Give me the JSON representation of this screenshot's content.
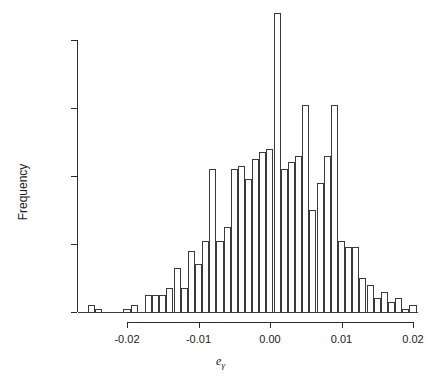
{
  "chart_data": {
    "type": "bar",
    "title": "",
    "subtitle": "",
    "xlabel": "e_gamma",
    "xlabel_base": "e",
    "xlabel_sub": "γ",
    "ylabel": "Frequency",
    "grid": false,
    "legend": null,
    "xlim": [
      -0.0255,
      0.0205
    ],
    "ylim": [
      0,
      88
    ],
    "bin_width": 0.001,
    "x_ticks": [
      -0.02,
      -0.01,
      0.0,
      0.01,
      0.02
    ],
    "x_tick_labels": [
      "-0.02",
      "-0.01",
      "0.00",
      "0.01",
      "0.02"
    ],
    "y_ticks": [
      0,
      20,
      40,
      60,
      80
    ],
    "y_tick_labels": [
      "0",
      "20",
      "40",
      "60",
      "80"
    ],
    "bin_left_edges": [
      -0.0255,
      -0.0245,
      -0.0235,
      -0.0225,
      -0.0215,
      -0.0205,
      -0.0195,
      -0.0185,
      -0.0175,
      -0.0165,
      -0.0155,
      -0.0145,
      -0.0135,
      -0.0125,
      -0.0115,
      -0.0105,
      -0.0095,
      -0.0085,
      -0.0075,
      -0.0065,
      -0.0055,
      -0.0045,
      -0.0035,
      -0.0025,
      -0.0015,
      -0.0005,
      0.0005,
      0.0015,
      0.0025,
      0.0035,
      0.0045,
      0.0055,
      0.0065,
      0.0075,
      0.0085,
      0.0095,
      0.0105,
      0.0115,
      0.0125,
      0.0135,
      0.0145,
      0.0155,
      0.0165,
      0.0175,
      0.0185,
      0.0195
    ],
    "values": [
      2,
      1,
      0,
      0,
      0,
      1,
      2,
      0,
      5,
      5,
      5,
      7,
      13,
      7,
      18,
      14,
      21,
      42,
      21,
      25,
      42,
      43,
      39,
      45,
      47,
      48,
      88,
      42,
      44,
      46,
      61,
      30,
      38,
      46,
      61,
      21,
      19,
      19,
      10,
      8,
      4,
      6,
      3,
      4,
      1,
      2
    ],
    "categories": [
      "-0.0255",
      "-0.0245",
      "-0.0235",
      "-0.0225",
      "-0.0215",
      "-0.0205",
      "-0.0195",
      "-0.0185",
      "-0.0175",
      "-0.0165",
      "-0.0155",
      "-0.0145",
      "-0.0135",
      "-0.0125",
      "-0.0115",
      "-0.0105",
      "-0.0095",
      "-0.0085",
      "-0.0075",
      "-0.0065",
      "-0.0055",
      "-0.0045",
      "-0.0035",
      "-0.0025",
      "-0.0015",
      "-0.0005",
      "0.0005",
      "0.0015",
      "0.0025",
      "0.0035",
      "0.0045",
      "0.0055",
      "0.0065",
      "0.0075",
      "0.0085",
      "0.0095",
      "0.0105",
      "0.0115",
      "0.0125",
      "0.0135",
      "0.0145",
      "0.0155",
      "0.0165",
      "0.0175",
      "0.0185",
      "0.0195"
    ],
    "colors": {
      "bar_border": "#3a3a3a",
      "bar_fill": "transparent",
      "axis": "#2b2b2b",
      "text": "#1a1a1a",
      "background": "#ffffff"
    }
  }
}
